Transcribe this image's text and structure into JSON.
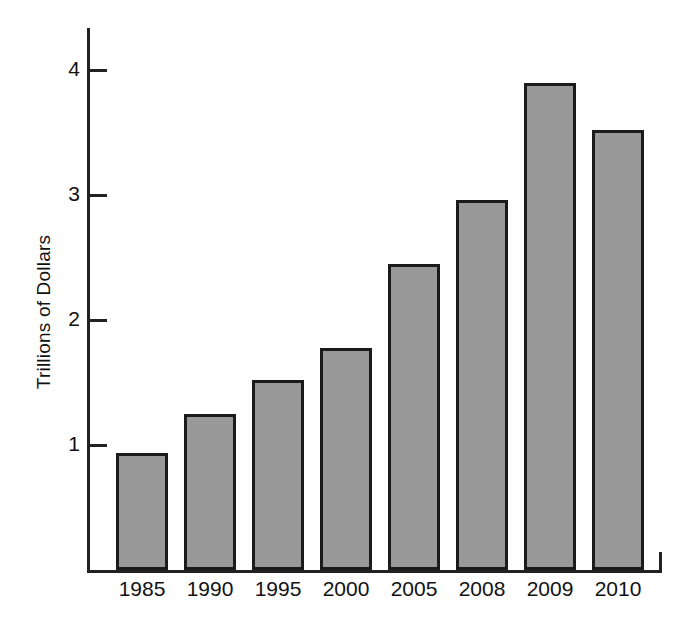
{
  "chart_data": {
    "type": "bar",
    "title": "",
    "xlabel": "",
    "ylabel": "Trillions of Dollars",
    "categories": [
      "1985",
      "1990",
      "1995",
      "2000",
      "2005",
      "2008",
      "2009",
      "2010"
    ],
    "values": [
      0.94,
      1.25,
      1.52,
      1.78,
      2.45,
      2.96,
      3.9,
      3.52
    ],
    "ylim": [
      0,
      4.35
    ],
    "yticks": [
      1,
      2,
      3,
      4
    ],
    "ytick_labels": [
      "1",
      "2",
      "3",
      "4"
    ],
    "grid": false,
    "legend": null,
    "bar_color": "#999999",
    "bar_edge_color": "#1b1b1b",
    "axis_color": "#222222",
    "background_color": "#ffffff"
  }
}
